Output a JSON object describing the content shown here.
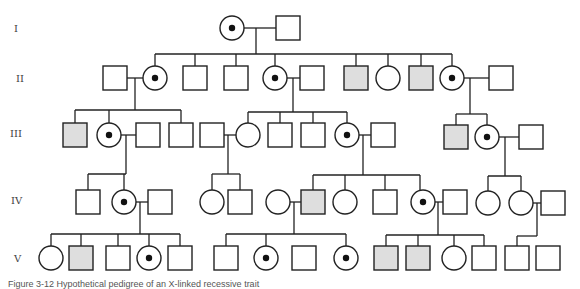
{
  "diagram": {
    "type": "pedigree",
    "generations": [
      "I",
      "II",
      "III",
      "IV",
      "V"
    ],
    "legend": {
      "square": "male",
      "circle": "female",
      "shaded_square": "affected male",
      "circle_with_dot": "carrier female"
    },
    "colors": {
      "stroke": "#222222",
      "affected_fill": "#dedede",
      "background": "#ffffff"
    },
    "individuals": [
      {
        "id": "I-1",
        "gen": "I",
        "sex": "F",
        "status": "carrier",
        "cx": 232,
        "cy": 28
      },
      {
        "id": "I-2",
        "gen": "I",
        "sex": "M",
        "status": "unaffected",
        "cx": 288,
        "cy": 28
      },
      {
        "id": "II-a",
        "gen": "II",
        "sex": "M",
        "status": "unaffected",
        "cx": 115,
        "cy": 78
      },
      {
        "id": "II-1",
        "gen": "II",
        "sex": "F",
        "status": "carrier",
        "cx": 155,
        "cy": 78
      },
      {
        "id": "II-2",
        "gen": "II",
        "sex": "M",
        "status": "unaffected",
        "cx": 195,
        "cy": 78
      },
      {
        "id": "II-3",
        "gen": "II",
        "sex": "M",
        "status": "unaffected",
        "cx": 236,
        "cy": 78
      },
      {
        "id": "II-4",
        "gen": "II",
        "sex": "F",
        "status": "carrier",
        "cx": 275,
        "cy": 78
      },
      {
        "id": "II-b",
        "gen": "II",
        "sex": "M",
        "status": "unaffected",
        "cx": 312,
        "cy": 78
      },
      {
        "id": "II-5",
        "gen": "II",
        "sex": "M",
        "status": "affected",
        "cx": 356,
        "cy": 78
      },
      {
        "id": "II-6",
        "gen": "II",
        "sex": "F",
        "status": "unaffected",
        "cx": 388,
        "cy": 78
      },
      {
        "id": "II-7",
        "gen": "II",
        "sex": "M",
        "status": "affected",
        "cx": 421,
        "cy": 78
      },
      {
        "id": "II-8",
        "gen": "II",
        "sex": "F",
        "status": "carrier",
        "cx": 452,
        "cy": 78
      },
      {
        "id": "II-c",
        "gen": "II",
        "sex": "M",
        "status": "unaffected",
        "cx": 501,
        "cy": 78
      },
      {
        "id": "III-1",
        "gen": "III",
        "sex": "M",
        "status": "affected",
        "cx": 75,
        "cy": 135
      },
      {
        "id": "III-2",
        "gen": "III",
        "sex": "F",
        "status": "carrier",
        "cx": 109,
        "cy": 135
      },
      {
        "id": "III-a",
        "gen": "III",
        "sex": "M",
        "status": "unaffected",
        "cx": 148,
        "cy": 135
      },
      {
        "id": "III-3",
        "gen": "III",
        "sex": "M",
        "status": "unaffected",
        "cx": 181,
        "cy": 135
      },
      {
        "id": "III-b",
        "gen": "III",
        "sex": "M",
        "status": "unaffected",
        "cx": 212,
        "cy": 135
      },
      {
        "id": "III-4",
        "gen": "III",
        "sex": "F",
        "status": "unaffected",
        "cx": 248,
        "cy": 135
      },
      {
        "id": "III-5",
        "gen": "III",
        "sex": "M",
        "status": "unaffected",
        "cx": 280,
        "cy": 135
      },
      {
        "id": "III-6",
        "gen": "III",
        "sex": "M",
        "status": "unaffected",
        "cx": 313,
        "cy": 135
      },
      {
        "id": "III-7",
        "gen": "III",
        "sex": "F",
        "status": "carrier",
        "cx": 347,
        "cy": 135
      },
      {
        "id": "III-c",
        "gen": "III",
        "sex": "M",
        "status": "unaffected",
        "cx": 383,
        "cy": 135
      },
      {
        "id": "III-8",
        "gen": "III",
        "sex": "M",
        "status": "affected",
        "cx": 456,
        "cy": 137
      },
      {
        "id": "III-9",
        "gen": "III",
        "sex": "F",
        "status": "carrier",
        "cx": 487,
        "cy": 137
      },
      {
        "id": "III-d",
        "gen": "III",
        "sex": "M",
        "status": "unaffected",
        "cx": 531,
        "cy": 137
      },
      {
        "id": "IV-1",
        "gen": "IV",
        "sex": "M",
        "status": "unaffected",
        "cx": 88,
        "cy": 202
      },
      {
        "id": "IV-2",
        "gen": "IV",
        "sex": "F",
        "status": "carrier",
        "cx": 124,
        "cy": 202
      },
      {
        "id": "IV-a",
        "gen": "IV",
        "sex": "M",
        "status": "unaffected",
        "cx": 160,
        "cy": 202
      },
      {
        "id": "IV-3",
        "gen": "IV",
        "sex": "F",
        "status": "unaffected",
        "cx": 212,
        "cy": 202
      },
      {
        "id": "IV-4",
        "gen": "IV",
        "sex": "M",
        "status": "unaffected",
        "cx": 240,
        "cy": 202
      },
      {
        "id": "IV-b",
        "gen": "IV",
        "sex": "F",
        "status": "unaffected",
        "cx": 278,
        "cy": 202
      },
      {
        "id": "IV-5",
        "gen": "IV",
        "sex": "M",
        "status": "affected",
        "cx": 313,
        "cy": 202
      },
      {
        "id": "IV-6",
        "gen": "IV",
        "sex": "F",
        "status": "unaffected",
        "cx": 345,
        "cy": 202
      },
      {
        "id": "IV-7",
        "gen": "IV",
        "sex": "M",
        "status": "unaffected",
        "cx": 385,
        "cy": 202
      },
      {
        "id": "IV-8",
        "gen": "IV",
        "sex": "F",
        "status": "carrier",
        "cx": 423,
        "cy": 202
      },
      {
        "id": "IV-c",
        "gen": "IV",
        "sex": "M",
        "status": "unaffected",
        "cx": 455,
        "cy": 202
      },
      {
        "id": "IV-9",
        "gen": "IV",
        "sex": "F",
        "status": "unaffected",
        "cx": 488,
        "cy": 203
      },
      {
        "id": "IV-10",
        "gen": "IV",
        "sex": "F",
        "status": "unaffected",
        "cx": 521,
        "cy": 203
      },
      {
        "id": "IV-d",
        "gen": "IV",
        "sex": "M",
        "status": "unaffected",
        "cx": 553,
        "cy": 203
      },
      {
        "id": "V-1",
        "gen": "V",
        "sex": "F",
        "status": "unaffected",
        "cx": 51,
        "cy": 258
      },
      {
        "id": "V-2",
        "gen": "V",
        "sex": "M",
        "status": "affected",
        "cx": 81,
        "cy": 258
      },
      {
        "id": "V-3",
        "gen": "V",
        "sex": "M",
        "status": "unaffected",
        "cx": 118,
        "cy": 258
      },
      {
        "id": "V-4",
        "gen": "V",
        "sex": "F",
        "status": "carrier",
        "cx": 149,
        "cy": 258
      },
      {
        "id": "V-5",
        "gen": "V",
        "sex": "M",
        "status": "unaffected",
        "cx": 180,
        "cy": 258
      },
      {
        "id": "V-6",
        "gen": "V",
        "sex": "M",
        "status": "unaffected",
        "cx": 226,
        "cy": 258
      },
      {
        "id": "V-7",
        "gen": "V",
        "sex": "F",
        "status": "carrier",
        "cx": 266,
        "cy": 258
      },
      {
        "id": "V-8",
        "gen": "V",
        "sex": "M",
        "status": "unaffected",
        "cx": 304,
        "cy": 258
      },
      {
        "id": "V-9",
        "gen": "V",
        "sex": "F",
        "status": "carrier",
        "cx": 346,
        "cy": 258
      },
      {
        "id": "V-10",
        "gen": "V",
        "sex": "M",
        "status": "affected",
        "cx": 386,
        "cy": 258
      },
      {
        "id": "V-11",
        "gen": "V",
        "sex": "M",
        "status": "affected",
        "cx": 418,
        "cy": 258
      },
      {
        "id": "V-12",
        "gen": "V",
        "sex": "F",
        "status": "unaffected",
        "cx": 454,
        "cy": 258
      },
      {
        "id": "V-13",
        "gen": "V",
        "sex": "M",
        "status": "unaffected",
        "cx": 484,
        "cy": 258
      },
      {
        "id": "V-14",
        "gen": "V",
        "sex": "M",
        "status": "unaffected",
        "cx": 517,
        "cy": 258
      },
      {
        "id": "V-15",
        "gen": "V",
        "sex": "M",
        "status": "unaffected",
        "cx": 548,
        "cy": 258
      }
    ],
    "lines": [
      [
        244,
        28,
        276,
        28
      ],
      [
        256,
        28,
        256,
        54
      ],
      [
        155,
        54,
        452,
        54
      ],
      [
        155,
        54,
        155,
        66
      ],
      [
        195,
        54,
        195,
        66
      ],
      [
        236,
        54,
        236,
        66
      ],
      [
        275,
        54,
        275,
        66
      ],
      [
        356,
        54,
        356,
        66
      ],
      [
        388,
        54,
        388,
        66
      ],
      [
        421,
        54,
        421,
        66
      ],
      [
        452,
        54,
        452,
        66
      ],
      [
        127,
        78,
        143,
        78
      ],
      [
        135,
        78,
        135,
        110
      ],
      [
        75,
        110,
        181,
        110
      ],
      [
        75,
        110,
        75,
        123
      ],
      [
        109,
        110,
        109,
        123
      ],
      [
        181,
        110,
        181,
        123
      ],
      [
        287,
        78,
        300,
        78
      ],
      [
        293,
        78,
        293,
        112
      ],
      [
        248,
        112,
        347,
        112
      ],
      [
        248,
        112,
        248,
        123
      ],
      [
        280,
        112,
        280,
        123
      ],
      [
        313,
        112,
        313,
        123
      ],
      [
        347,
        112,
        347,
        123
      ],
      [
        464,
        78,
        489,
        78
      ],
      [
        470,
        78,
        470,
        114
      ],
      [
        456,
        114,
        487,
        114
      ],
      [
        456,
        114,
        456,
        125
      ],
      [
        487,
        114,
        487,
        125
      ],
      [
        121,
        135,
        136,
        135
      ],
      [
        126,
        135,
        126,
        174
      ],
      [
        88,
        174,
        126,
        174
      ],
      [
        88,
        174,
        88,
        190
      ],
      [
        124,
        174,
        124,
        190
      ],
      [
        224,
        135,
        236,
        135
      ],
      [
        228,
        135,
        228,
        174
      ],
      [
        212,
        174,
        240,
        174
      ],
      [
        212,
        174,
        212,
        190
      ],
      [
        240,
        174,
        240,
        190
      ],
      [
        359,
        135,
        371,
        135
      ],
      [
        363,
        135,
        363,
        175
      ],
      [
        313,
        175,
        420,
        175
      ],
      [
        313,
        175,
        313,
        190
      ],
      [
        345,
        175,
        345,
        190
      ],
      [
        385,
        175,
        385,
        190
      ],
      [
        420,
        175,
        420,
        190
      ],
      [
        499,
        137,
        519,
        137
      ],
      [
        505,
        137,
        505,
        176
      ],
      [
        488,
        176,
        521,
        176
      ],
      [
        488,
        176,
        488,
        191
      ],
      [
        521,
        176,
        521,
        191
      ],
      [
        136,
        202,
        148,
        202
      ],
      [
        140,
        202,
        140,
        234
      ],
      [
        51,
        234,
        180,
        234
      ],
      [
        51,
        234,
        51,
        246
      ],
      [
        81,
        234,
        81,
        246
      ],
      [
        118,
        234,
        118,
        246
      ],
      [
        149,
        234,
        149,
        246
      ],
      [
        180,
        234,
        180,
        246
      ],
      [
        290,
        202,
        301,
        202
      ],
      [
        294,
        202,
        294,
        234
      ],
      [
        226,
        234,
        346,
        234
      ],
      [
        226,
        234,
        226,
        246
      ],
      [
        266,
        234,
        266,
        246
      ],
      [
        346,
        234,
        346,
        246
      ],
      [
        435,
        202,
        443,
        202
      ],
      [
        438,
        202,
        438,
        235
      ],
      [
        386,
        235,
        484,
        235
      ],
      [
        386,
        235,
        386,
        246
      ],
      [
        418,
        235,
        418,
        246
      ],
      [
        454,
        235,
        454,
        246
      ],
      [
        484,
        235,
        484,
        246
      ],
      [
        533,
        203,
        541,
        203
      ],
      [
        537,
        203,
        537,
        236
      ],
      [
        517,
        236,
        537,
        236
      ],
      [
        517,
        236,
        517,
        246
      ]
    ]
  },
  "caption": {
    "text": "Figure 3-12 Hypothetical pedigree of an X-linked recessive trait"
  }
}
